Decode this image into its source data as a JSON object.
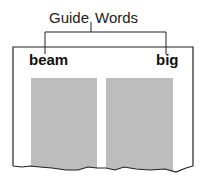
{
  "diagram": {
    "title_left": "Guide",
    "title_right": "Words",
    "guide_words": {
      "left": "beam",
      "right": "big"
    },
    "colors": {
      "line": "#222222",
      "column_fill": "#bdbdbd",
      "background": "#ffffff"
    }
  }
}
